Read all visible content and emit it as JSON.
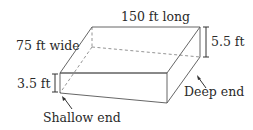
{
  "diagram": {
    "type": "pool-prism",
    "labels": {
      "length": "150 ft long",
      "width": "75 ft wide",
      "deep_depth": "5.5 ft",
      "shallow_depth": "3.5 ft",
      "deep_end": "Deep end",
      "shallow_end": "Shallow end"
    },
    "colors": {
      "edge": "#555555",
      "hidden_edge": "#888888",
      "text": "#2a2a2a"
    }
  }
}
